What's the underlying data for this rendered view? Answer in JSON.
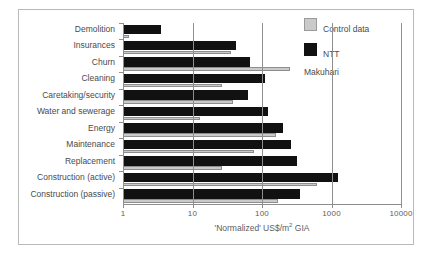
{
  "chart_data": {
    "type": "bar",
    "orientation": "horizontal",
    "title": "",
    "xlabel": "'Normalized' US$/m2 GIA",
    "xlabel_pretty": "'Normalized' US$/m² GIA",
    "ylabel": "",
    "xscale": "log",
    "xlim": [
      1,
      10000
    ],
    "xticks": [
      1,
      10,
      100,
      1000,
      10000
    ],
    "xticklabels": [
      "1",
      "10",
      "100",
      "1000",
      "10000"
    ],
    "grid": "vertical gridlines at each decade",
    "legend_position": "top-right outside plot",
    "categories": [
      "Demolition",
      "Insurances",
      "Churn",
      "Cleaning",
      "Caretaking/security",
      "Water and sewerage",
      "Energy",
      "Maintenance",
      "Replacement",
      "Construction (active)",
      "Construction (passive)"
    ],
    "series": [
      {
        "name": "NTT Makuhari",
        "color": "#111111",
        "values": [
          3.5,
          42,
          68,
          110,
          62,
          120,
          200,
          265,
          320,
          1250,
          350
        ]
      },
      {
        "name": "Control data",
        "color": "#cacaca",
        "values": [
          1.2,
          36,
          250,
          27,
          38,
          13,
          160,
          76,
          27,
          620,
          170
        ]
      }
    ]
  },
  "legend": {
    "items": [
      {
        "label": "Control data",
        "color": "#cacaca"
      },
      {
        "label": "NTT\nMakuhari",
        "color": "#111111"
      }
    ]
  },
  "axis": {
    "x_tick_labels": [
      "1",
      "10",
      "100",
      "1000",
      "10000"
    ],
    "x_axis_title_prefix": "'Normalized' US$/m",
    "x_axis_title_sup": "2",
    "x_axis_title_suffix": " GIA"
  },
  "colors": {
    "ntt": "#111111",
    "control": "#cacaca",
    "axis": "#8e8e8e",
    "text": "#4a4a4a",
    "frame": "#b9b9b9",
    "background": "#ffffff"
  }
}
